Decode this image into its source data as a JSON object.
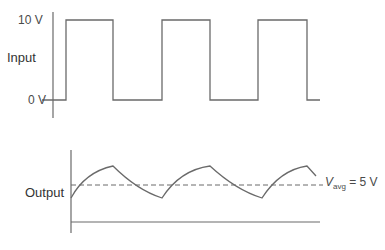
{
  "input": {
    "label": "Input",
    "high_tick": "10 V",
    "low_tick": "0 V"
  },
  "output": {
    "label": "Output",
    "avg_var": "V",
    "avg_sub": "avg",
    "avg_value": "= 5 V"
  },
  "colors": {
    "stroke": "#6a6a6a",
    "text": "#4a4a4a"
  }
}
